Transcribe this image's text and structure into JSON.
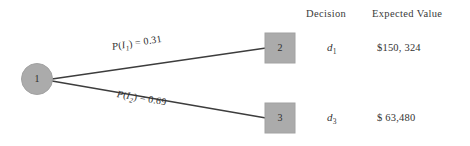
{
  "diagram": {
    "type": "decision-tree",
    "colors": {
      "node_fill": "#ababab",
      "node_stroke": "#9a9a9a",
      "branch_line": "#3d3d3d",
      "background": "#ffffff",
      "text": "#2e2e2e"
    },
    "root_node": {
      "shape": "circle",
      "label": "1"
    },
    "terminal_nodes": [
      {
        "shape": "square",
        "label": "2"
      },
      {
        "shape": "square",
        "label": "3"
      }
    ],
    "branches": [
      {
        "name": "upper-branch",
        "prob_prefix": "P",
        "prob_var": "I",
        "prob_sub": "1",
        "prob_value": "0.31",
        "label_full": "P(I1) = 0.31"
      },
      {
        "name": "lower-branch",
        "prob_prefix": "P",
        "prob_var": "I",
        "prob_sub": "2",
        "prob_value": "0.69",
        "label_full": "P(I2) = 0.69"
      }
    ]
  },
  "table": {
    "headers": {
      "decision": "Decision",
      "expected_value": "Expected Value"
    },
    "rows": [
      {
        "node": "2",
        "decision_var": "d",
        "decision_sub": "1",
        "expected_value": "$150, 324"
      },
      {
        "node": "3",
        "decision_var": "d",
        "decision_sub": "3",
        "expected_value": "$ 63,480"
      }
    ]
  }
}
